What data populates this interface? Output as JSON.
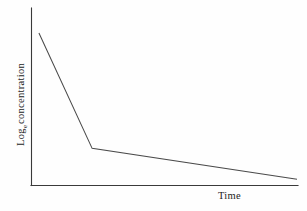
{
  "figure": {
    "background_color": "#fefefe",
    "line_color": "#4a4a4a",
    "axis_color": "#3a3a3a"
  },
  "axes": {
    "x_title": "Time",
    "y_title_main": "Log",
    "y_title_subscript": "e",
    "y_title_rest": " concentration",
    "y_title_full": "Loge concentration"
  },
  "chart_data": {
    "type": "line",
    "title": "",
    "subtitle": "",
    "xlabel": "Time",
    "ylabel": "Loge concentration",
    "grid": false,
    "legend": false,
    "legend_position": "none",
    "x_tick_labels": [],
    "y_tick_labels": [],
    "xlim": [
      0,
      100
    ],
    "ylim": [
      0,
      100
    ],
    "series": [
      {
        "name": "Log concentration decay",
        "x": [
          1.5,
          21.8,
          100.0
        ],
        "y": [
          92.6,
          20.9,
          1.7
        ],
        "points": [
          {
            "x": 1.5,
            "y": 92.6,
            "role": "start"
          },
          {
            "x": 21.8,
            "y": 20.9,
            "role": "breakpoint"
          },
          {
            "x": 100.0,
            "y": 1.7,
            "role": "end"
          }
        ],
        "segments": [
          {
            "name": "distribution-phase",
            "slope": "steep"
          },
          {
            "name": "elimination-phase",
            "slope": "shallow"
          }
        ]
      }
    ]
  }
}
